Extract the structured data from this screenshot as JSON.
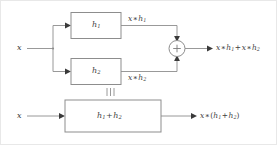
{
  "figure": {
    "kind": "block-diagram",
    "topic": "Distributive property of convolution: parallel interconnection equals single system"
  },
  "top_system": {
    "input_label": "x",
    "branch1": {
      "block_label_base": "h",
      "block_label_sub": "1",
      "output_label_base": "x",
      "output_label_op": "∗",
      "output_label_term_base": "h",
      "output_label_term_sub": "1"
    },
    "branch2": {
      "block_label_base": "h",
      "block_label_sub": "2",
      "output_label_base": "x",
      "output_label_op": "∗",
      "output_label_term_base": "h",
      "output_label_term_sub": "2"
    },
    "adder": {
      "symbol": "+",
      "name": "summing-junction"
    },
    "output": {
      "t1_base": "x",
      "t1_op": "∗",
      "t1_term_base": "h",
      "t1_term_sub": "1",
      "plus": "+",
      "t2_base": "x",
      "t2_op": "∗",
      "t2_term_base": "h",
      "t2_term_sub": "2"
    }
  },
  "equivalence": {
    "symbol": "≡",
    "meaning": "is equivalent to"
  },
  "bottom_system": {
    "input_label": "x",
    "block": {
      "term1_base": "h",
      "term1_sub": "1",
      "plus": "+",
      "term2_base": "h",
      "term2_sub": "2"
    },
    "output": {
      "base": "x",
      "op": "∗",
      "open_paren": "(",
      "term1_base": "h",
      "term1_sub": "1",
      "plus": "+",
      "term2_base": "h",
      "term2_sub": "2",
      "close_paren": ")"
    }
  },
  "colors": {
    "stroke": "#8d8d8d",
    "text": "#3d3d3d",
    "arrow": "#3a3a3a",
    "background": "#ffffff",
    "frame": "#e8e8e8"
  }
}
